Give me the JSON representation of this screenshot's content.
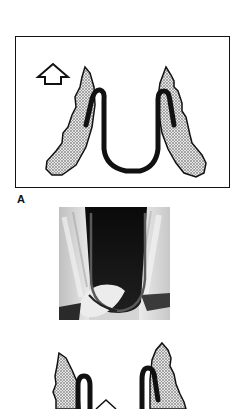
{
  "figure": {
    "panel_a": {
      "label": "A",
      "description": "Schematic of wire spring between two tooth crowns with upward arrow",
      "arrow_direction": "up"
    },
    "photo": {
      "description": "Radiograph/photo of U-shaped wire loop between teeth"
    },
    "panel_b": {
      "description": "Partial schematic of second wire configuration between tooth crowns"
    },
    "colors": {
      "line": "#111111",
      "crown_fill": "#bdbdbd",
      "background": "#ffffff"
    }
  }
}
